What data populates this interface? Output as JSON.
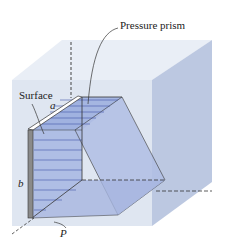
{
  "diagram": {
    "type": "hydrostatic pressure prism on submerged vertical rectangular surface",
    "labels": {
      "pressure_prism": "Pressure prism",
      "surface": "Surface",
      "width": "a",
      "height": "b",
      "pressure": "P"
    },
    "colors": {
      "fluid_front": "#dfe6f1",
      "fluid_top": "#e9eef6",
      "fluid_side": "#b9c6e0",
      "prism_fill": "#a9b8e2",
      "prism_slant": "#b3c0e4",
      "surface_plate": "#8a8a8a",
      "lines": "#333333",
      "pressure_lines": "#3f56a8"
    }
  }
}
